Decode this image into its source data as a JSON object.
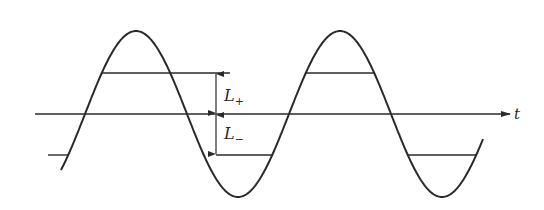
{
  "figure": {
    "type": "sinusoid-with-thresholds",
    "axis_label": "t",
    "labels": {
      "upper": {
        "main": "L",
        "sub": "+"
      },
      "lower": {
        "main": "L",
        "sub": "−"
      }
    },
    "colors": {
      "stroke": "#2a2a2a",
      "background": "#ffffff"
    },
    "geometry": {
      "axis_y": 114,
      "axis_x_start": 35,
      "axis_x_end": 510,
      "amplitude": 83,
      "period": 204,
      "first_peak_x": 136,
      "curve_x_start": 61,
      "curve_x_end": 483,
      "upper_level_y": 73,
      "lower_level_y": 155,
      "dimension_x": 216
    }
  }
}
